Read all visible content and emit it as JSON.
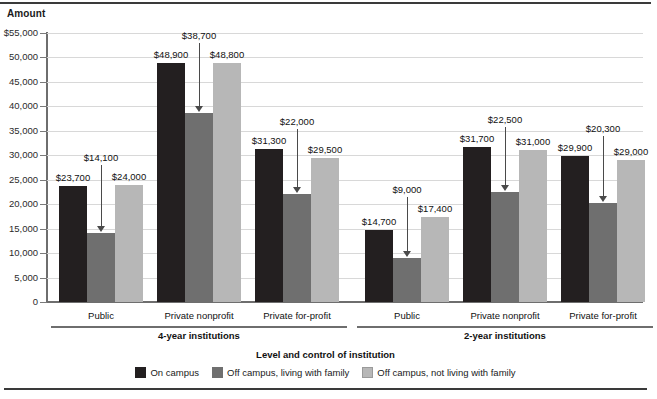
{
  "axis_titles": {
    "y": "Amount",
    "x": "Level and control of institution"
  },
  "legend": {
    "items": [
      {
        "label": "On campus",
        "color": "#231f20",
        "icon": "legend-swatch-icon"
      },
      {
        "label": "Off campus, living with family",
        "color": "#6f6f6f",
        "icon": "legend-swatch-icon"
      },
      {
        "label": "Off campus, not living with family",
        "color": "#b7b7b7",
        "icon": "legend-swatch-icon"
      }
    ]
  },
  "groups": [
    {
      "label": "4-year institutions"
    },
    {
      "label": "2-year institutions"
    }
  ],
  "caption": "",
  "chart_data": {
    "type": "bar",
    "title": "",
    "xlabel": "Level and control of institution",
    "ylabel": "Amount",
    "ylim": [
      0,
      55000
    ],
    "ytick_values": [
      0,
      5000,
      10000,
      15000,
      20000,
      25000,
      30000,
      35000,
      40000,
      45000,
      50000,
      55000
    ],
    "ytick_labels": [
      "0",
      "5,000",
      "10,000",
      "15,000",
      "20,000",
      "25,000",
      "30,000",
      "35,000",
      "40,000",
      "45,000",
      "50,000",
      "$55,000"
    ],
    "grid": true,
    "legend_position": "bottom",
    "group_labels": [
      "4-year institutions",
      "2-year institutions"
    ],
    "categories": [
      "Public",
      "Private nonprofit",
      "Private for-profit",
      "Public",
      "Private nonprofit",
      "Private for-profit"
    ],
    "category_groups": [
      0,
      0,
      0,
      1,
      1,
      1
    ],
    "series": [
      {
        "name": "On campus",
        "color": "#231f20",
        "values": [
          23700,
          48900,
          31300,
          14700,
          31700,
          29900
        ],
        "value_labels": [
          "$23,700",
          "$48,900",
          "$31,300",
          "$14,700",
          "$31,700",
          "$29,900"
        ]
      },
      {
        "name": "Off campus, living with family",
        "color": "#6f6f6f",
        "values": [
          14100,
          38700,
          22000,
          9000,
          22500,
          20300
        ],
        "value_labels": [
          "$14,100",
          "$38,700",
          "$22,000",
          "$9,000",
          "$22,500",
          "$20,300"
        ],
        "labels_use_callout_arrow": true
      },
      {
        "name": "Off campus, not living with family",
        "color": "#b7b7b7",
        "values": [
          24000,
          48800,
          29500,
          17400,
          31000,
          29000
        ],
        "value_labels": [
          "$24,000",
          "$48,800",
          "$29,500",
          "$17,400",
          "$31,000",
          "$29,000"
        ]
      }
    ]
  }
}
